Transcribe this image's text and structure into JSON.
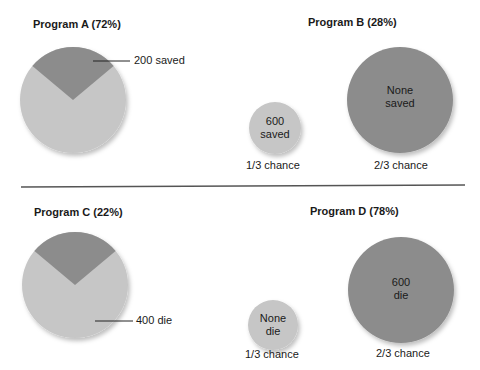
{
  "colors": {
    "light": "#c6c6c6",
    "dark": "#8c8c8c",
    "divider": "#555555",
    "text": "#1a1a1a"
  },
  "top": {
    "program_a": {
      "title": "Program A (72%)",
      "label": "200 saved",
      "pie_dark_fraction": 0.3333
    },
    "program_b": {
      "title": "Program B (28%)",
      "small": {
        "line1": "600",
        "line2": "saved",
        "caption": "1/3 chance"
      },
      "large": {
        "line1": "None",
        "line2": "saved",
        "caption": "2/3 chance"
      }
    }
  },
  "bottom": {
    "program_c": {
      "title": "Program C (22%)",
      "label": "400 die",
      "pie_light_fraction": 0.6667
    },
    "program_d": {
      "title": "Program D (78%)",
      "small": {
        "line1": "None",
        "line2": "die",
        "caption": "1/3 chance"
      },
      "large": {
        "line1": "600",
        "line2": "die",
        "caption": "2/3 chance"
      }
    }
  }
}
